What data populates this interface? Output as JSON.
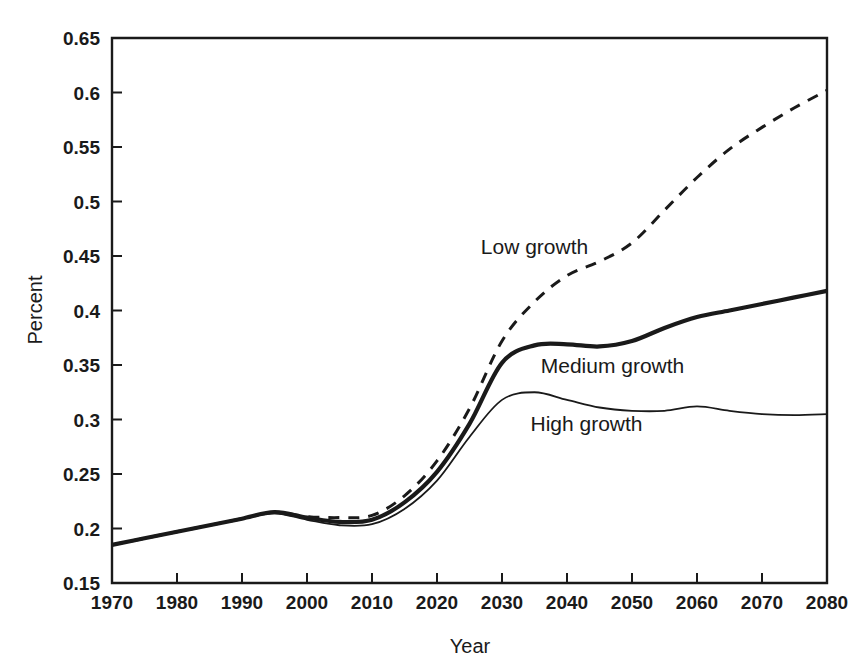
{
  "chart_data": {
    "type": "line",
    "title": "",
    "xlabel": "Year",
    "ylabel": "Percent",
    "xlim": [
      1970,
      2080
    ],
    "ylim": [
      0.15,
      0.65
    ],
    "grid": false,
    "legend_position": "inline-annotations",
    "x_ticks": [
      1970,
      1980,
      1990,
      2000,
      2010,
      2020,
      2030,
      2040,
      2050,
      2060,
      2070,
      2080
    ],
    "x_tick_labels": [
      "1970",
      "1980",
      "1990",
      "2000",
      "2010",
      "2020",
      "2030",
      "2040",
      "2050",
      "2060",
      "2070",
      "2080"
    ],
    "y_ticks": [
      0.15,
      0.2,
      0.25,
      0.3,
      0.35,
      0.4,
      0.45,
      0.5,
      0.55,
      0.6,
      0.65
    ],
    "y_tick_labels": [
      "0.15",
      "0.2",
      "0.25",
      "0.3",
      "0.35",
      "0.4",
      "0.45",
      "0.5",
      "0.55",
      "0.6",
      "0.65"
    ],
    "x": [
      1970,
      1975,
      1980,
      1985,
      1990,
      1995,
      2000,
      2005,
      2010,
      2015,
      2020,
      2025,
      2030,
      2035,
      2040,
      2045,
      2050,
      2055,
      2060,
      2065,
      2070,
      2075,
      2080
    ],
    "series": [
      {
        "name": "Low growth",
        "style": "dashed",
        "color": "#1a1a1a",
        "stroke_width": 3,
        "label_x": 2035,
        "label_y": 0.452,
        "values": [
          0.185,
          0.191,
          0.197,
          0.203,
          0.209,
          0.215,
          0.211,
          0.21,
          0.212,
          0.23,
          0.262,
          0.31,
          0.372,
          0.408,
          0.432,
          0.445,
          0.462,
          0.492,
          0.522,
          0.548,
          0.568,
          0.586,
          0.602
        ]
      },
      {
        "name": "Medium growth",
        "style": "solid",
        "color": "#1a1a1a",
        "stroke_width": 4.2,
        "label_x": 2047,
        "label_y": 0.343,
        "values": [
          0.185,
          0.191,
          0.197,
          0.203,
          0.209,
          0.215,
          0.21,
          0.206,
          0.208,
          0.224,
          0.252,
          0.296,
          0.352,
          0.368,
          0.369,
          0.367,
          0.372,
          0.384,
          0.394,
          0.4,
          0.406,
          0.412,
          0.418
        ]
      },
      {
        "name": "High growth",
        "style": "solid",
        "color": "#1a1a1a",
        "stroke_width": 1.8,
        "label_x": 2043,
        "label_y": 0.289,
        "values": [
          0.185,
          0.191,
          0.197,
          0.203,
          0.209,
          0.214,
          0.208,
          0.203,
          0.204,
          0.218,
          0.244,
          0.284,
          0.318,
          0.325,
          0.318,
          0.311,
          0.308,
          0.308,
          0.312,
          0.308,
          0.305,
          0.304,
          0.305
        ]
      }
    ]
  },
  "axis": {
    "x_title": "Year",
    "y_title": "Percent"
  },
  "annotations": {
    "low": "Low growth",
    "medium": "Medium growth",
    "high": "High growth"
  }
}
